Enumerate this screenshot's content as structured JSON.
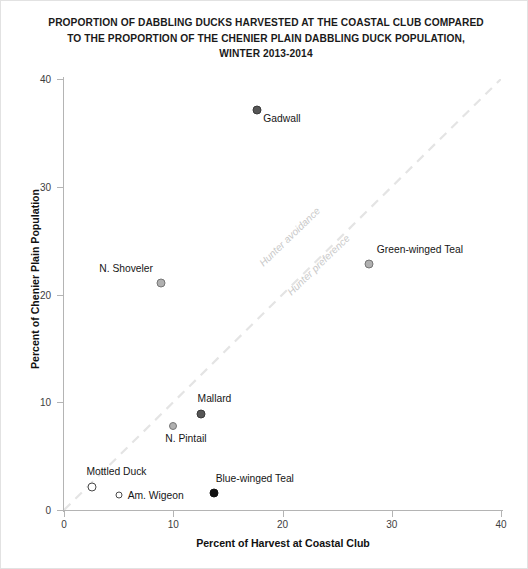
{
  "chart_data": {
    "type": "scatter",
    "title": "PROPORTION OF DABBLING DUCKS HARVESTED AT THE COASTAL CLUB COMPARED TO THE PROPORTION OF THE CHENIER PLAIN DABBLING DUCK POPULATION, WINTER 2013-2014",
    "title_lines": [
      "PROPORTION OF DABBLING DUCKS HARVESTED AT THE COASTAL CLUB COMPARED",
      "TO THE PROPORTION OF THE CHENIER PLAIN DABBLING DUCK POPULATION,",
      "WINTER 2013-2014"
    ],
    "xlabel": "Percent of Harvest at Coastal Club",
    "ylabel": "Percent of Chenier Plain Population",
    "xlim": [
      0,
      40
    ],
    "ylim": [
      0,
      40
    ],
    "xticks": [
      0,
      10,
      20,
      30,
      40
    ],
    "yticks": [
      0,
      10,
      20,
      30,
      40
    ],
    "xtick_labels": [
      "0",
      "10",
      "20",
      "30",
      "40"
    ],
    "ytick_labels": [
      "0",
      "10",
      "20",
      "30",
      "40"
    ],
    "grid": false,
    "legend": "none",
    "points": [
      {
        "label": "Gadwall",
        "x": 17.7,
        "y": 37.1,
        "marker": "filled-dark",
        "size": 9,
        "label_dx": 6,
        "label_dy": 9
      },
      {
        "label": "Green-winged Teal",
        "x": 27.9,
        "y": 22.8,
        "marker": "filled-light",
        "size": 9,
        "label_dx": 8,
        "label_dy": -14
      },
      {
        "label": "N. Shoveler",
        "x": 8.9,
        "y": 21.1,
        "marker": "filled-light",
        "size": 9,
        "label_dx": -62,
        "label_dy": -14
      },
      {
        "label": "Mallard",
        "x": 12.5,
        "y": 8.9,
        "marker": "filled-dark",
        "size": 9,
        "label_dx": -3,
        "label_dy": -15
      },
      {
        "label": "N. Pintail",
        "x": 10.0,
        "y": 7.8,
        "marker": "filled-light",
        "size": 8,
        "label_dx": -8,
        "label_dy": 13
      },
      {
        "label": "Mottled Duck",
        "x": 2.6,
        "y": 2.1,
        "marker": "open",
        "size": 9,
        "label_dx": -6,
        "label_dy": -15
      },
      {
        "label": "Am. Wigeon",
        "x": 5.0,
        "y": 1.4,
        "marker": "open",
        "size": 7,
        "label_dx": 9,
        "label_dy": 1
      },
      {
        "label": "Blue-winged Teal",
        "x": 13.7,
        "y": 1.6,
        "marker": "filled-black",
        "size": 9,
        "label_dx": 2,
        "label_dy": -14
      }
    ],
    "reference_line": {
      "description": "1:1 dashed diagonal",
      "from": [
        0,
        0
      ],
      "to": [
        40,
        40
      ],
      "style": "dashed",
      "color": "#e4e4e4"
    },
    "annotations": [
      {
        "text": "Hunter avoidance",
        "x": 18.0,
        "y": 23.3,
        "rotation": -44,
        "color": "#c9c9c9"
      },
      {
        "text": "Hunter preference",
        "x": 20.6,
        "y": 20.6,
        "rotation": -44,
        "color": "#c9c9c9"
      }
    ]
  }
}
